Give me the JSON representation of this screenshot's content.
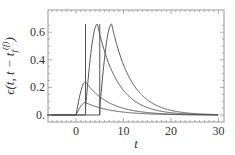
{
  "chart_data": {
    "type": "line",
    "title": "",
    "xlabel": "t",
    "ylabel": "ϵ(t, t − t_f^{(f)})",
    "ylabel_parts": {
      "main": "ϵ(t, t − t",
      "sub": "f",
      "sup": "(f)",
      "close": ")"
    },
    "xlim": [
      -6,
      31
    ],
    "ylim": [
      -0.05,
      0.7
    ],
    "xticks": [
      0,
      10,
      20,
      30
    ],
    "xtick_labels": [
      "0",
      "10",
      "20",
      "30"
    ],
    "yticks": [
      0,
      0.2,
      0.4,
      0.6
    ],
    "ytick_labels": [
      "0.",
      "0.2",
      "0.4",
      "0.6"
    ],
    "grid": false,
    "legend": null,
    "series": [
      {
        "name": "curve-small",
        "onset": 0,
        "jump": null,
        "peak_t": 2,
        "peak": 0.09,
        "tau": 5.5
      },
      {
        "name": "curve-medium",
        "onset": 0,
        "jump": null,
        "peak_t": 2,
        "peak": 0.24,
        "tau": 5.0
      },
      {
        "name": "curve-tall-1",
        "onset": 2,
        "jump": 2,
        "peak_t": 4.5,
        "peak": 0.66,
        "tau": 4.2
      },
      {
        "name": "curve-tall-2",
        "onset": 5,
        "jump": 5,
        "peak_t": 7.5,
        "peak": 0.66,
        "tau": 4.2
      }
    ],
    "line_color": "#555555",
    "frame_color": "#999999"
  }
}
